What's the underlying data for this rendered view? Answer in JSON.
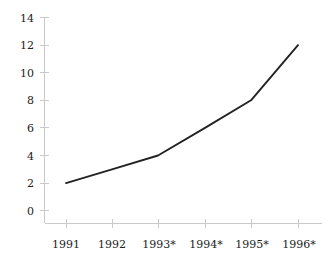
{
  "chart_data": {
    "type": "line",
    "title": "",
    "subtitle": "",
    "xlabel": "",
    "ylabel": "",
    "categories": [
      "1991",
      "1992",
      "1993*",
      "1994*",
      "1995*",
      "1996*"
    ],
    "values": [
      2,
      3,
      4,
      6,
      8,
      12
    ],
    "series": [
      {
        "name": "",
        "values": [
          2,
          3,
          4,
          6,
          8,
          12
        ]
      }
    ],
    "ylim": [
      0,
      14
    ],
    "yticks": [
      0,
      2,
      4,
      6,
      8,
      10,
      12,
      14
    ],
    "ytick_labels": [
      "0",
      "2",
      "4",
      "6",
      "8",
      "10",
      "12",
      "14"
    ],
    "xtick_labels": [
      "1991",
      "1992",
      "1993*",
      "1994*",
      "1995*",
      "1996*"
    ],
    "grid": false,
    "legend": false,
    "legend_position": "none",
    "annotations": [],
    "markers": false,
    "colors": {
      "line": "#232323",
      "axis": "#c9c9c9",
      "text": "#222222",
      "background": "#ffffff"
    }
  }
}
